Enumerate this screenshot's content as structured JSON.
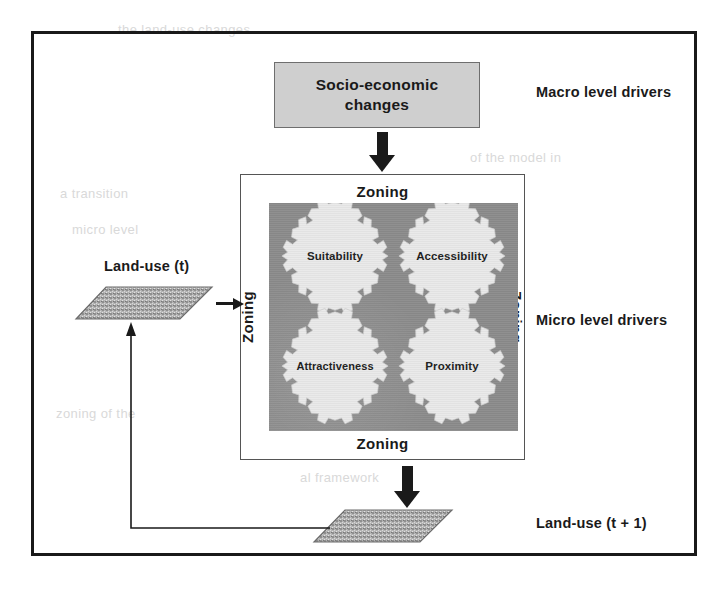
{
  "figure": {
    "macro_box": {
      "line1": "Socio-economic",
      "line2": "changes"
    },
    "zoning": {
      "top": "Zoning",
      "bottom": "Zoning",
      "left": "Zoning",
      "right": "Zoning"
    },
    "gears": [
      {
        "id": "suitability",
        "label": "Suitability"
      },
      {
        "id": "accessibility",
        "label": "Accessibility"
      },
      {
        "id": "attractiveness",
        "label": "Attractiveness"
      },
      {
        "id": "proximity",
        "label": "Proximity"
      }
    ],
    "labels": {
      "landuse_t": "Land-use (t)",
      "landuse_t1": "Land-use (t + 1)",
      "macro_level": "Macro level drivers",
      "micro_level": "Micro level drivers"
    },
    "colors": {
      "frame": "#191919",
      "macro_box_fill": "#cfcfcf",
      "gear_field_fill": "#8b8b8b",
      "gear_fill": "#e9e9e9",
      "arrow": "#1a1a1a",
      "raster_fill": "#a8a8a8"
    },
    "icons": {
      "arrow_down_macro": "thick-down-arrow-icon",
      "arrow_down_output": "thick-down-arrow-icon",
      "arrow_right_input": "right-arrow-icon",
      "feedback_arrow": "feedback-up-arrow-icon",
      "raster_t": "raster-layer-icon",
      "raster_t1": "raster-layer-icon"
    },
    "ghost_text": [
      "the land-use changes",
      "of the model in",
      "a transition",
      "micro level",
      "zoning of the",
      "al framework"
    ]
  }
}
